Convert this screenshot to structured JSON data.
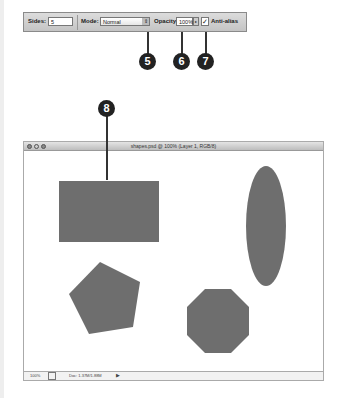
{
  "toolbar": {
    "sides_label": "Sides:",
    "sides_value": "5",
    "mode_label": "Mode:",
    "mode_value": "Normal",
    "opacity_label": "Opacity:",
    "opacity_value": "100%",
    "antialias_label": "Anti-alias",
    "antialias_checked": true
  },
  "callouts": [
    "5",
    "6",
    "7",
    "8"
  ],
  "window": {
    "title": "shapes.psd @ 100% (Layer 1, RGB/8)",
    "status_zoom": "100%",
    "status_doc": "Doc: 1.37M/1.88M"
  },
  "shapes": {
    "fill_color": "#6e6e6e",
    "items": [
      "rectangle",
      "ellipse",
      "pentagon",
      "octagon"
    ]
  }
}
